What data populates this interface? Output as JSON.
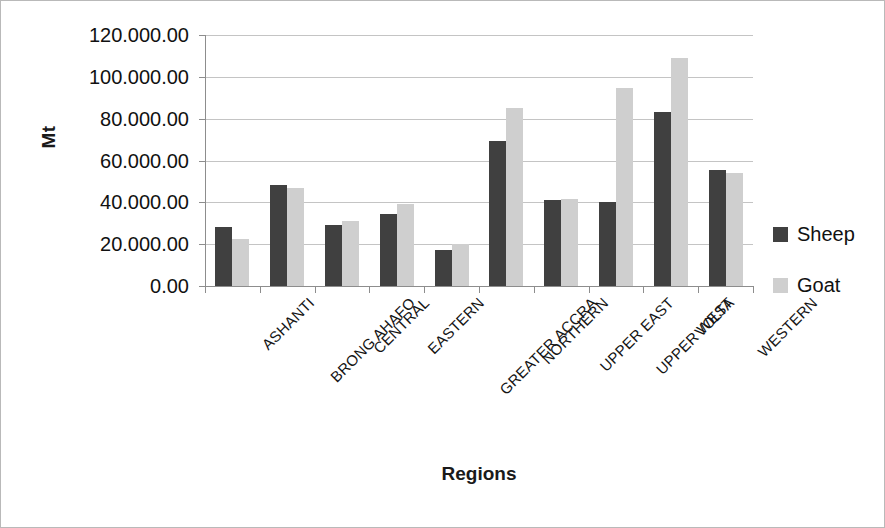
{
  "chart_data": {
    "type": "bar",
    "title": "",
    "xlabel": "Regions",
    "ylabel": "Mt",
    "ylim": [
      0,
      120000
    ],
    "ytick_step": 20000,
    "grid": true,
    "legend_position": "right",
    "categories": [
      "ASHANTI",
      "BRONG AHAFO",
      "CENTRAL",
      "EASTERN",
      "GREATER ACCRA",
      "NORTHERN",
      "UPPER EAST",
      "UPPER WEST",
      "VOLTA",
      "WESTERN"
    ],
    "ytick_labels": [
      "0.00",
      "20.000.00",
      "40.000.00",
      "60.000.00",
      "80.000.00",
      "100.000.00",
      "120.000.00"
    ],
    "ytick_values": [
      0,
      20000,
      40000,
      60000,
      80000,
      100000,
      120000
    ],
    "series": [
      {
        "name": "Sheep",
        "color": "#404040",
        "values": [
          28000,
          48200,
          29300,
          34200,
          17200,
          69500,
          41200,
          40300,
          83200,
          55400
        ]
      },
      {
        "name": "Goat",
        "color": "#cfcfcf",
        "values": [
          22500,
          47000,
          31000,
          39200,
          20200,
          85000,
          41600,
          94800,
          109000,
          54000
        ]
      }
    ]
  },
  "legend": {
    "items": [
      {
        "label": "Sheep",
        "color": "#404040"
      },
      {
        "label": "Goat",
        "color": "#cfcfcf"
      }
    ]
  }
}
